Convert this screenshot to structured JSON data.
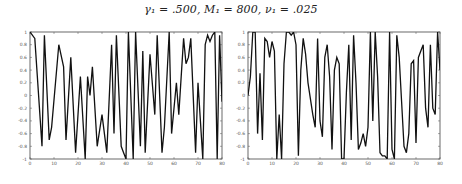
{
  "title": "γ₁ = .500, M₁ = 800, ν₁ = .025",
  "chart_data": [
    {
      "type": "line",
      "title": "",
      "xlabel": "",
      "ylabel": "",
      "xlim": [
        0,
        80
      ],
      "ylim": [
        -1,
        1
      ],
      "grid": false,
      "xticks": [
        0,
        10,
        20,
        30,
        40,
        50,
        60,
        70,
        80
      ],
      "yticks": [
        -1,
        -0.8,
        -0.6,
        -0.4,
        -0.2,
        0,
        0.2,
        0.4,
        0.6,
        0.8,
        1
      ],
      "xtick_labels": [
        "0",
        "10",
        "20",
        "30",
        "40",
        "50",
        "60",
        "70",
        "80"
      ],
      "ytick_labels": [
        "-1",
        "-0.8",
        "-0.6",
        "-0.4",
        "-0.2",
        "0",
        "0.2",
        "0.4",
        "0.6",
        "0.8",
        "1"
      ],
      "series": [
        {
          "name": "left",
          "x": [
            0,
            2,
            5,
            6,
            8,
            9,
            12,
            14,
            15,
            17,
            19,
            21,
            23,
            24,
            25,
            26,
            28,
            30,
            32,
            34,
            35,
            36,
            38,
            39,
            40,
            41,
            43,
            44,
            46,
            47,
            48,
            50,
            52,
            53,
            55,
            56,
            58,
            59,
            61,
            62,
            64,
            65,
            66,
            67,
            69,
            70,
            72,
            73,
            74,
            75,
            76,
            77,
            78,
            79,
            80
          ],
          "y": [
            1,
            0.9,
            -0.8,
            0.95,
            -0.7,
            -0.5,
            0.8,
            0.45,
            -0.7,
            0.6,
            -0.9,
            0.3,
            -1,
            0.3,
            0,
            0.45,
            -0.8,
            -0.3,
            -0.9,
            0.8,
            -0.6,
            0.95,
            -0.8,
            -0.9,
            -1,
            1,
            -1,
            1,
            -0.8,
            0.7,
            -0.9,
            0.65,
            -0.3,
            0.95,
            -0.9,
            -0.5,
            1,
            -0.6,
            0.2,
            -0.3,
            0.9,
            0.5,
            0.6,
            0.9,
            -0.9,
            0.2,
            -1,
            0.8,
            0.95,
            0.85,
            0.95,
            1,
            -1,
            0.95,
            -0.1
          ]
        },
        {
          "name": "right",
          "x": [
            0,
            1,
            2,
            3,
            4,
            5,
            6,
            7,
            8,
            9,
            10,
            11,
            12,
            13,
            14,
            15,
            16,
            17,
            18,
            19,
            20,
            21,
            22,
            23,
            24,
            25,
            27,
            28,
            29,
            30,
            31,
            32,
            33,
            34,
            35,
            36,
            37,
            38,
            39,
            40,
            41,
            42,
            43,
            44,
            45,
            46,
            47,
            48,
            49,
            50,
            51,
            52,
            53,
            54,
            55,
            56,
            57,
            58,
            59,
            60,
            61,
            62,
            63,
            64,
            65,
            66,
            67,
            68,
            69,
            70,
            71,
            72,
            73,
            74,
            75,
            76,
            77,
            78,
            79,
            80
          ],
          "y": [
            0,
            0.3,
            1,
            1,
            -0.6,
            0.35,
            -0.7,
            0.9,
            0.85,
            0.6,
            0.85,
            0.7,
            -1,
            -0.3,
            -1,
            0.5,
            1,
            1,
            0.95,
            1,
            0.8,
            -0.95,
            0.4,
            0.9,
            0.65,
            0.2,
            -0.3,
            -0.5,
            0.9,
            -0.4,
            -0.65,
            0.6,
            0.8,
            0.3,
            -0.85,
            0.4,
            0.6,
            0.5,
            -1,
            -1,
            0.05,
            0.8,
            -0.7,
            0.95,
            0.2,
            -0.85,
            -0.75,
            -0.6,
            -0.8,
            -0.5,
            1,
            -0.4,
            1,
            0.3,
            -0.9,
            -0.95,
            -0.95,
            -1,
            1,
            -0.85,
            -1,
            0.95,
            0.6,
            -0.1,
            -0.8,
            -0.9,
            -0.6,
            0.5,
            0.55,
            -0.75,
            0.6,
            0.7,
            0.8,
            -0.2,
            -0.5,
            0.8,
            -0.2,
            -0.3,
            1,
            0.4
          ]
        }
      ]
    }
  ]
}
